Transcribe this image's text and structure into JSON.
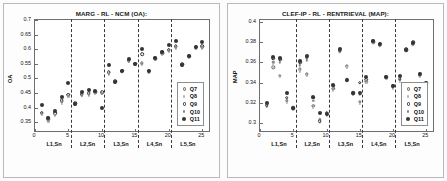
{
  "figure": {
    "panels": [
      "left",
      "right"
    ]
  },
  "legend": {
    "entries": [
      {
        "label": "Q7",
        "marker": "open-circle-gray"
      },
      {
        "label": "Q8",
        "marker": "small-dot-light"
      },
      {
        "label": "Q9",
        "marker": "open-circle-white"
      },
      {
        "label": "Q10",
        "marker": "small-dot-gray"
      },
      {
        "label": "Q11",
        "marker": "filled-circle-dark"
      }
    ]
  },
  "chart_data": [
    {
      "id": "left",
      "type": "scatter",
      "title": "MARG - RL - NCM (OA):",
      "xlabel": "",
      "ylabel": "OA",
      "ylim": [
        0.32,
        0.7
      ],
      "yticks": [
        0.35,
        0.4,
        0.45,
        0.5,
        0.55,
        0.6,
        0.65,
        0.7
      ],
      "ytick_labels": [
        "0.35",
        "0.4",
        "0.45",
        "0.5",
        "0.55",
        "0.6",
        "0.65",
        "0.7"
      ],
      "xlim": [
        0,
        26
      ],
      "xticks": [
        0,
        5,
        10,
        15,
        20,
        25
      ],
      "xtick_labels": [
        "0",
        "5",
        "10",
        "15",
        "20",
        "25"
      ],
      "group_labels": [
        "L1,Sn",
        "L2,Sn",
        "L3,Sn",
        "L4,Sn",
        "L5,Sn"
      ],
      "group_centers": [
        3,
        8,
        13,
        18,
        23
      ],
      "dividers": [
        5.5,
        10.5,
        15.5,
        20.5
      ],
      "grid": false,
      "legend_position": "lower-right",
      "x": [
        1,
        2,
        3,
        4,
        5,
        6,
        7,
        8,
        9,
        10,
        11,
        12,
        13,
        14,
        15,
        16,
        17,
        18,
        19,
        20,
        21,
        22,
        23,
        24,
        25
      ],
      "series": [
        {
          "name": "Q7",
          "values": [
            0.381,
            0.359,
            0.378,
            0.422,
            0.443,
            0.414,
            0.444,
            0.447,
            0.452,
            0.451,
            0.519,
            0.489,
            0.525,
            0.561,
            0.549,
            0.552,
            0.523,
            0.568,
            0.586,
            0.596,
            0.608,
            0.546,
            0.575,
            0.604,
            0.608
          ]
        },
        {
          "name": "Q8",
          "values": [
            0.374,
            0.352,
            0.372,
            0.414,
            0.436,
            0.409,
            0.439,
            0.441,
            0.447,
            0.447,
            0.513,
            0.486,
            0.521,
            0.556,
            0.545,
            0.546,
            0.519,
            0.564,
            0.582,
            0.591,
            0.603,
            0.543,
            0.572,
            0.6,
            0.603
          ]
        },
        {
          "name": "Q9",
          "values": [
            0.382,
            0.363,
            0.381,
            0.425,
            0.444,
            0.416,
            0.446,
            0.449,
            0.455,
            0.453,
            0.522,
            0.491,
            0.527,
            0.563,
            0.551,
            0.583,
            0.526,
            0.57,
            0.589,
            0.598,
            0.611,
            0.548,
            0.577,
            0.606,
            0.611
          ]
        },
        {
          "name": "Q10",
          "values": [
            0.378,
            0.357,
            0.375,
            0.419,
            0.44,
            0.412,
            0.442,
            0.444,
            0.45,
            0.449,
            0.516,
            0.488,
            0.523,
            0.559,
            0.547,
            0.549,
            0.521,
            0.566,
            0.584,
            0.594,
            0.606,
            0.545,
            0.574,
            0.602,
            0.606
          ]
        },
        {
          "name": "Q11",
          "values": [
            0.408,
            0.364,
            0.39,
            0.436,
            0.484,
            0.412,
            0.453,
            0.459,
            0.457,
            0.399,
            0.546,
            0.489,
            0.526,
            0.566,
            0.55,
            0.6,
            0.524,
            0.57,
            0.591,
            0.613,
            0.628,
            0.547,
            0.577,
            0.607,
            0.623
          ]
        }
      ]
    },
    {
      "id": "right",
      "type": "scatter",
      "title": "CLEF-IP - RL - RENTRIEVAL (MAP):",
      "xlabel": "",
      "ylabel": "MAP",
      "ylim": [
        0.292,
        0.402
      ],
      "yticks": [
        0.3,
        0.32,
        0.34,
        0.36,
        0.38,
        0.4
      ],
      "ytick_labels": [
        "0.3",
        "0.32",
        "0.34",
        "0.36",
        "0.38",
        "0.4"
      ],
      "xlim": [
        0,
        26
      ],
      "xticks": [
        0,
        5,
        10,
        15,
        20,
        25
      ],
      "xtick_labels": [
        "0",
        "5",
        "10",
        "15",
        "20",
        "25"
      ],
      "group_labels": [
        "L1,Sn",
        "L2,Sn",
        "L3,Sn",
        "L4,Sn",
        "L5,Sn"
      ],
      "group_centers": [
        3,
        8,
        13,
        18,
        23
      ],
      "dividers": [
        5.5,
        10.5,
        15.5,
        20.5
      ],
      "grid": false,
      "legend_position": "lower-right",
      "x": [
        1,
        2,
        3,
        4,
        5,
        6,
        7,
        8,
        9,
        10,
        11,
        12,
        13,
        14,
        15,
        16,
        17,
        18,
        19,
        20,
        21,
        22,
        23,
        24,
        25
      ],
      "series": [
        {
          "name": "Q7",
          "values": [
            0.318,
            0.355,
            0.347,
            0.322,
            0.315,
            0.353,
            0.348,
            0.317,
            0.303,
            0.309,
            0.334,
            0.371,
            0.356,
            0.33,
            0.321,
            0.341,
            0.38,
            0.377,
            0.345,
            0.336,
            0.343,
            0.372,
            0.378,
            0.347,
            0.339
          ]
        },
        {
          "name": "Q8",
          "values": [
            0.316,
            0.357,
            0.346,
            0.32,
            0.313,
            0.351,
            0.347,
            0.315,
            0.301,
            0.307,
            0.332,
            0.37,
            0.355,
            0.328,
            0.319,
            0.34,
            0.379,
            0.376,
            0.344,
            0.334,
            0.341,
            0.371,
            0.377,
            0.346,
            0.338
          ]
        },
        {
          "name": "Q9",
          "values": [
            0.317,
            0.364,
            0.363,
            0.325,
            0.314,
            0.36,
            0.365,
            0.325,
            0.302,
            0.31,
            0.337,
            0.372,
            0.342,
            0.329,
            0.34,
            0.343,
            0.381,
            0.378,
            0.346,
            0.337,
            0.344,
            0.373,
            0.38,
            0.348,
            0.34
          ]
        },
        {
          "name": "Q10",
          "values": [
            0.319,
            0.36,
            0.36,
            0.323,
            0.316,
            0.357,
            0.362,
            0.322,
            0.304,
            0.308,
            0.335,
            0.373,
            0.344,
            0.331,
            0.328,
            0.342,
            0.38,
            0.377,
            0.345,
            0.335,
            0.346,
            0.372,
            0.379,
            0.347,
            0.339
          ]
        },
        {
          "name": "Q11",
          "values": [
            0.32,
            0.365,
            0.364,
            0.33,
            0.315,
            0.361,
            0.366,
            0.326,
            0.31,
            0.309,
            0.338,
            0.373,
            0.343,
            0.33,
            0.33,
            0.346,
            0.381,
            0.378,
            0.346,
            0.337,
            0.347,
            0.372,
            0.379,
            0.348,
            0.34
          ]
        }
      ]
    }
  ]
}
